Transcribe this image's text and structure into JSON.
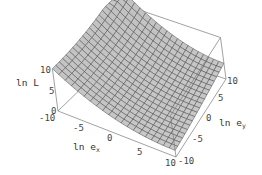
{
  "chart_data": {
    "type": "surface3d",
    "title": "",
    "xlabel": "ln e",
    "xlabel_sub": "x",
    "ylabel": "ln e",
    "ylabel_sub": "y",
    "zlabel": "ln L",
    "xlim": [
      -10,
      10
    ],
    "ylim": [
      -10,
      10
    ],
    "zlim": [
      0,
      10
    ],
    "x_ticks": [
      "-10",
      "-5",
      "0",
      "5",
      "10"
    ],
    "y_ticks": [
      "-10",
      "-5",
      "0",
      "5",
      "10"
    ],
    "z_ticks": [
      "0",
      "5",
      "10"
    ],
    "grid_cells": 20,
    "surface_description": "Valley-shaped surface: high (≈10+) at ln e_x = -10 / ln e_y = 10 back edge, decreasing to minimum near ln e_x ≈ 10, ln e_y ≈ -10 front corner; flat shelf toward ln e_y = 10 at right",
    "surface_samples": [
      {
        "x": -10,
        "y": -10,
        "z": 10
      },
      {
        "x": -10,
        "y": 10,
        "z": 10
      },
      {
        "x": 0,
        "y": 10,
        "z": 5
      },
      {
        "x": 10,
        "y": 10,
        "z": 4
      },
      {
        "x": 10,
        "y": 0,
        "z": 3
      },
      {
        "x": 10,
        "y": -10,
        "z": 2
      },
      {
        "x": 0,
        "y": 0,
        "z": 3
      },
      {
        "x": 0,
        "y": -10,
        "z": 4
      }
    ],
    "box": true,
    "grid": false,
    "colors": {
      "surface": "#c4c4c4",
      "surface_shadow": "#8e8e8e",
      "mesh": "#3a3a3a",
      "box": "#7a7a7a"
    }
  },
  "labels": {
    "x_axis": "ln e",
    "x_sub": "x",
    "y_axis": "ln e",
    "y_sub": "y",
    "z_axis": "ln L"
  },
  "ticks": {
    "z_0": "0",
    "z_5": "5",
    "z_10": "10",
    "x_m10": "-10",
    "x_m5": "-5",
    "x_0": "0",
    "x_5": "5",
    "x_10": "10",
    "y_m10": "-10",
    "y_m5": "-5",
    "y_0": "0",
    "y_5": "5",
    "y_10": "10"
  }
}
